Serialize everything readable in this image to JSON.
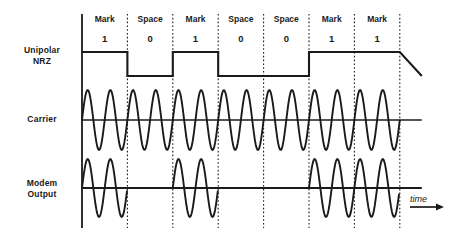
{
  "diagram": {
    "time_axis_label": "time",
    "rows": [
      {
        "id": "nrz",
        "label_line1": "Unipolar",
        "label_line2": "NRZ"
      },
      {
        "id": "carrier",
        "label_line1": "Carrier",
        "label_line2": ""
      },
      {
        "id": "modem",
        "label_line1": "Modem",
        "label_line2": "Output"
      }
    ]
  },
  "chart_data": {
    "type": "line",
    "xlabel": "time",
    "ylabel": "",
    "grid": false,
    "legend": "none",
    "bit_labels": [
      "Mark",
      "Space",
      "Mark",
      "Space",
      "Space",
      "Mark",
      "Mark"
    ],
    "bits": [
      "1",
      "0",
      "1",
      "0",
      "0",
      "1",
      "1"
    ],
    "bit_values": [
      1,
      0,
      1,
      0,
      0,
      1,
      1
    ],
    "bit_count": 7,
    "carrier_cycles_per_bit": 2,
    "series": [
      {
        "name": "Unipolar NRZ",
        "type": "square",
        "values": [
          1,
          0,
          1,
          0,
          0,
          1,
          1
        ]
      },
      {
        "name": "Carrier",
        "type": "sine-continuous",
        "values": [
          1,
          1,
          1,
          1,
          1,
          1,
          1
        ]
      },
      {
        "name": "Modem Output",
        "type": "sine-gated",
        "values": [
          1,
          0,
          1,
          0,
          0,
          1,
          1
        ]
      }
    ]
  },
  "geometry": {
    "x_start": 82,
    "bit_width": 45.4,
    "nrz_high_y": 52,
    "nrz_base_y": 76,
    "carrier_mid_y": 120,
    "carrier_amp": 30,
    "modem_mid_y": 188,
    "modem_amp": 29,
    "boundary_top": 14,
    "boundary_bottom": 228
  },
  "colors": {
    "ink": "#1a1a1a",
    "background": "#ffffff"
  }
}
